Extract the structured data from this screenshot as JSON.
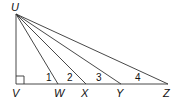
{
  "diagram": {
    "points": {
      "U": {
        "label": "U",
        "x": 16,
        "y": 14
      },
      "V": {
        "label": "V",
        "x": 16,
        "y": 84
      },
      "W": {
        "label": "W",
        "x": 58,
        "y": 84
      },
      "X": {
        "label": "X",
        "x": 86,
        "y": 84
      },
      "Y": {
        "label": "Y",
        "x": 121,
        "y": 84
      },
      "Z": {
        "label": "Z",
        "x": 168,
        "y": 84
      }
    },
    "angles": [
      {
        "label": "1",
        "at": "W"
      },
      {
        "label": "2",
        "at": "X"
      },
      {
        "label": "3",
        "at": "Y"
      },
      {
        "label": "4",
        "at": "Z"
      }
    ],
    "right_angle_at": "V"
  }
}
